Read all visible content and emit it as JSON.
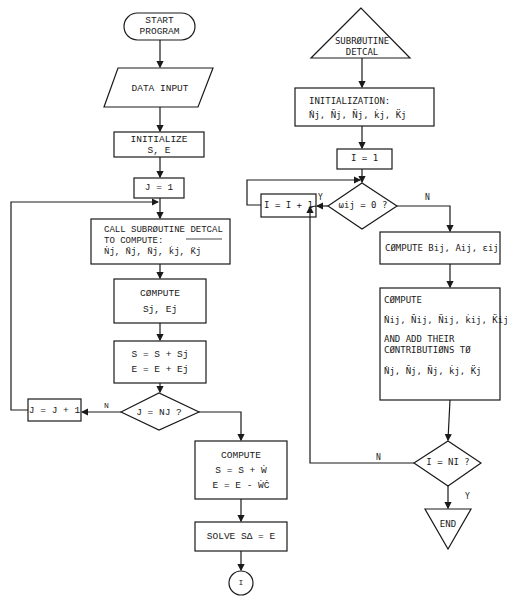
{
  "left_flow": {
    "start": {
      "line1": "START",
      "line2": "PROGRAM"
    },
    "data_input": "DATA INPUT",
    "initialize": {
      "line1": "INITIALIZE",
      "line2": "S, E"
    },
    "j_init": "J  =  1",
    "call_detcal": {
      "line1a": "CALL SUBRØUTINE ",
      "line1b": "DETCAL",
      "line2": "TO COMPUTE:",
      "line3": "Ṅj, N̄j, N̈j, k̇j, K̈j"
    },
    "compute_sj": {
      "line1": "CØMPUTE",
      "line2": "Sj, Ej"
    },
    "accumulate": {
      "line1": "S = S + Sj",
      "line2": "E = E + Ej"
    },
    "j_increment": "J = J + 1",
    "decision_j": "J = NJ ?",
    "decision_j_no": "N",
    "compute_final": {
      "line1": "COMPUTE",
      "line2": "S = S + Ẇ",
      "line3": "E = E - ẆĊ"
    },
    "solve": "SOLVE SΔ = E",
    "connector": "I"
  },
  "right_flow": {
    "start": {
      "line1": "SUBRØUTINE",
      "line2": "DETCAL"
    },
    "initialization": {
      "line1": "INITIALIZATION:",
      "line2": "Ṅj, N̄j, N̈j, k̇j, K̈j"
    },
    "i_init": "I = 1",
    "i_increment": "I = I + 1",
    "decision_omega": "ωij = 0 ?",
    "decision_omega_yes": "Y",
    "decision_omega_no": "N",
    "compute_bae": "CØMPUTE  Bij, Aij, εij",
    "compute_contrib": {
      "line1": "CØMPUTE",
      "line2": "Ṅij, N̄ij, N̈ij, k̇ij, K̈ij",
      "line3": "AND ADD THEIR",
      "line4": "CØNTRIBUTIØNS TØ",
      "line5": "Ṅj, N̄j, N̈j, k̇j, K̈j"
    },
    "decision_i": "I = NI ?",
    "decision_i_no": "N",
    "decision_i_yes": "Y",
    "end": "END"
  }
}
